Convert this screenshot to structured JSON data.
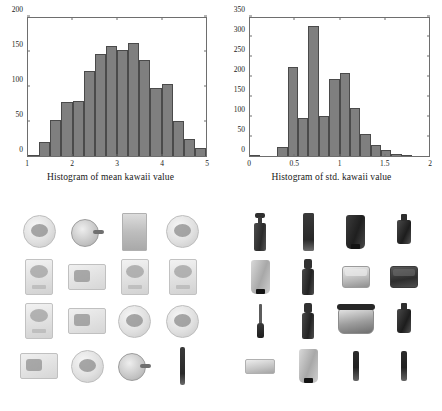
{
  "figure": {
    "bottom_caption": ""
  },
  "charts": [
    {
      "caption": "Histogram of mean kawaii value",
      "chart_data": {
        "type": "bar",
        "title": "Histogram of mean kawaii value",
        "xlabel": "",
        "ylabel": "",
        "xlim": [
          1,
          5
        ],
        "ylim": [
          0,
          200
        ],
        "xticks": [
          "1",
          "2",
          "3",
          "4",
          "5"
        ],
        "yticks": [
          "0",
          "50",
          "100",
          "150",
          "200"
        ],
        "grid": false,
        "legend": "none",
        "bin_edges": [
          1.0,
          1.2667,
          1.5333,
          1.8,
          2.0667,
          2.3333,
          2.6,
          2.8667,
          3.1333,
          3.4,
          3.6667,
          3.9333,
          4.2,
          4.4667,
          4.7333,
          5.0
        ],
        "categories": [
          "1.13",
          "1.40",
          "1.67",
          "1.93",
          "2.20",
          "2.47",
          "2.73",
          "3.00",
          "3.27",
          "3.53",
          "3.80",
          "4.07",
          "4.33",
          "4.60",
          "4.87"
        ],
        "values": [
          2,
          21,
          52,
          78,
          80,
          123,
          148,
          159,
          154,
          164,
          139,
          99,
          105,
          51,
          25,
          11
        ]
      }
    },
    {
      "caption": "Histogram of  std. kawaii value",
      "chart_data": {
        "type": "bar",
        "title": "Histogram of  std. kawaii value",
        "xlabel": "",
        "ylabel": "",
        "xlim": [
          0,
          2
        ],
        "ylim": [
          0,
          350
        ],
        "xticks": [
          "0",
          "0.5",
          "1",
          "1.5",
          "2"
        ],
        "yticks": [
          "0",
          "50",
          "100",
          "150",
          "200",
          "250",
          "300",
          "350"
        ],
        "grid": false,
        "legend": "none",
        "categories": [
          "0.06",
          "0.17",
          "0.28",
          "0.39",
          "0.50",
          "0.61",
          "0.72",
          "0.83",
          "0.94",
          "1.06",
          "1.17",
          "1.28",
          "1.39",
          "1.50",
          "1.61",
          "1.72",
          "1.83",
          "1.94"
        ],
        "values": [
          3,
          0,
          0,
          22,
          225,
          97,
          330,
          102,
          195,
          211,
          122,
          56,
          27,
          14,
          4,
          2,
          0,
          0
        ]
      }
    }
  ],
  "grids": [
    {
      "name": "kawaii-product-grid",
      "rows": 4,
      "columns": 4,
      "items": [
        {
          "kind": "round-pack"
        },
        {
          "kind": "pan-pack"
        },
        {
          "kind": "tall-sheet"
        },
        {
          "kind": "round-pack"
        },
        {
          "kind": "sq-pack"
        },
        {
          "kind": "wide-pack"
        },
        {
          "kind": "sq-pack"
        },
        {
          "kind": "sq-pack"
        },
        {
          "kind": "sq-pack"
        },
        {
          "kind": "wide-pack"
        },
        {
          "kind": "round-pack"
        },
        {
          "kind": "round-pack"
        },
        {
          "kind": "wide-pack"
        },
        {
          "kind": "round-pack"
        },
        {
          "kind": "pan-pack"
        },
        {
          "kind": "pencil"
        }
      ]
    },
    {
      "name": "non-kawaii-product-grid",
      "rows": 4,
      "columns": 4,
      "items": [
        {
          "kind": "bottle-pump"
        },
        {
          "kind": "pencil-pair"
        },
        {
          "kind": "tube"
        },
        {
          "kind": "flacon"
        },
        {
          "kind": "tube-light"
        },
        {
          "kind": "spray"
        },
        {
          "kind": "jar"
        },
        {
          "kind": "jar-dark"
        },
        {
          "kind": "brush"
        },
        {
          "kind": "spray"
        },
        {
          "kind": "jar-wide"
        },
        {
          "kind": "flacon"
        },
        {
          "kind": "compact"
        },
        {
          "kind": "tube-light"
        },
        {
          "kind": "stick"
        },
        {
          "kind": "stick"
        }
      ]
    }
  ]
}
